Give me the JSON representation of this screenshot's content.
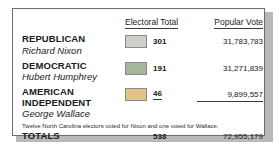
{
  "table": {
    "headers": {
      "party_column": "",
      "electoral_total": "Electoral Total",
      "popular_vote": "Popular Vote"
    },
    "rows": [
      {
        "party": "REPUBLICAN",
        "candidate": "Richard Nixon",
        "swatch_color": "#cfcfc9",
        "electoral_total": "301",
        "popular_vote": "31,783,783"
      },
      {
        "party": "DEMOCRATIC",
        "candidate": "Hubert Humphrey",
        "swatch_color": "#a5b79a",
        "electoral_total": "191",
        "popular_vote": "31,271,839"
      },
      {
        "party_line1": "AMERICAN",
        "party_line2": "INDEPENDENT",
        "candidate": "George Wallace",
        "swatch_color": "#e2c484",
        "electoral_total": "46",
        "popular_vote": "9,899,557"
      }
    ],
    "totals": {
      "label": "TOTALS",
      "electoral_total": "538",
      "popular_vote": "72,955,179"
    },
    "footnote": "Twelve North Carolina electors voted for Nixon and one voted for Wallace."
  },
  "chart_data": {
    "type": "table",
    "columns": [
      "Party / Candidate",
      "Electoral Total",
      "Popular Vote"
    ],
    "categories": [
      "Republican — Richard Nixon",
      "Democratic — Hubert Humphrey",
      "American Independent — George Wallace"
    ],
    "series": [
      {
        "name": "Electoral Total",
        "values": [
          301,
          191,
          46
        ]
      },
      {
        "name": "Popular Vote",
        "values": [
          31783783,
          31271839,
          9899557
        ]
      }
    ],
    "totals": {
      "Electoral Total": 538,
      "Popular Vote": 72955179
    },
    "swatch_colors": [
      "#cfcfc9",
      "#a5b79a",
      "#e2c484"
    ],
    "annotations": [
      "Twelve North Carolina electors voted for Nixon and one voted for Wallace."
    ],
    "legend": "inline-swatch",
    "grid": false
  }
}
